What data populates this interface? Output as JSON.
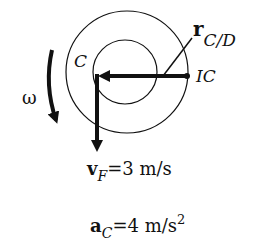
{
  "diagram": {
    "labels": {
      "center": "C",
      "instant_center": "IC",
      "omega": "ω",
      "r_main": "r",
      "r_sub": "C/D",
      "v_main": "v",
      "v_sub": "F",
      "v_value": "=3 m/s",
      "a_main": "a",
      "a_sub": "C",
      "a_value": "=4 m/s",
      "a_exp": "2"
    },
    "colors": {
      "ink": "#111111",
      "background": "#ffffff"
    }
  }
}
